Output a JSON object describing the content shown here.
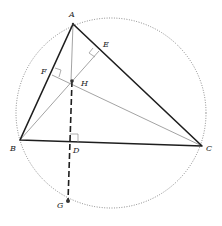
{
  "diagram": {
    "colors": {
      "triangle": "#1e1e1e",
      "altitude": "#8c8c8c",
      "circle": "#6e6e6e",
      "dashed": "#1e1e1e",
      "point": "#333333"
    },
    "circle": {
      "cx": 111,
      "cy": 113,
      "r": 95,
      "style": "dotted"
    },
    "points": {
      "A": {
        "label": "A",
        "x": 73,
        "y": 24
      },
      "B": {
        "label": "B",
        "x": 20,
        "y": 140
      },
      "C": {
        "label": "C",
        "x": 202,
        "y": 146
      },
      "D": {
        "label": "D",
        "x": 70,
        "y": 142
      },
      "E": {
        "label": "E",
        "x": 99,
        "y": 51
      },
      "F": {
        "label": "F",
        "x": 52,
        "y": 75
      },
      "H": {
        "label": "H",
        "x": 72,
        "y": 81
      },
      "G": {
        "label": "G",
        "x": 68,
        "y": 201
      }
    },
    "segments": [
      {
        "from": "A",
        "to": "B",
        "style": "thick"
      },
      {
        "from": "A",
        "to": "C",
        "style": "thick"
      },
      {
        "from": "B",
        "to": "C",
        "style": "thick"
      },
      {
        "from": "A",
        "to": "D",
        "style": "thin"
      },
      {
        "from": "B",
        "to": "E",
        "style": "thin"
      },
      {
        "from": "C",
        "to": "F",
        "style": "thin"
      },
      {
        "from": "H",
        "to": "G",
        "style": "dashed"
      }
    ],
    "right_angle_marks": [
      "D",
      "E",
      "F"
    ]
  }
}
